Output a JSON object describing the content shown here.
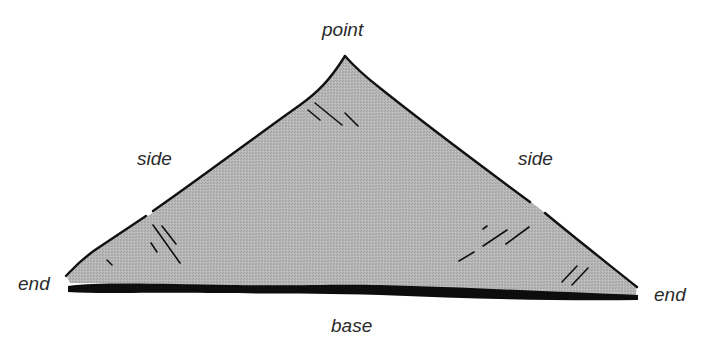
{
  "diagram": {
    "fill_color": "#b4b4b4",
    "outline_color": "#111111",
    "labels": {
      "point": "point",
      "side_left": "side",
      "side_right": "side",
      "end_left": "end",
      "end_right": "end",
      "base": "base"
    }
  }
}
